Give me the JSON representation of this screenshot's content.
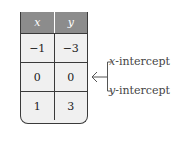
{
  "table": {
    "headers": [
      "x",
      "y"
    ],
    "rows": [
      [
        "−1",
        "−3"
      ],
      [
        "0",
        "0"
      ],
      [
        "1",
        "3"
      ]
    ],
    "header_color": "#8c8c8c",
    "cell_color": "#f0f0f0"
  },
  "annotations": {
    "x_intercept": {
      "var": "x",
      "label": "-intercept"
    },
    "y_intercept": {
      "var": "y",
      "label": "-intercept"
    },
    "arrow_icon": "left-arrow-icon"
  }
}
